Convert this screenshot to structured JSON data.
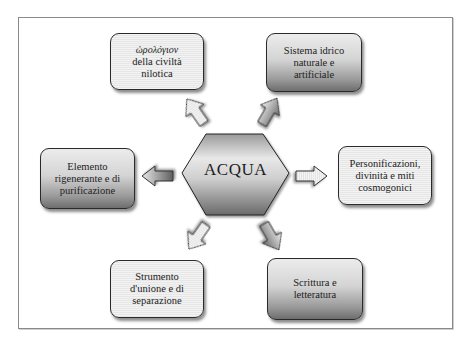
{
  "diagram": {
    "center": {
      "label": "ACQUA"
    },
    "nodes": [
      {
        "id": "top-left",
        "lines": [
          "ὡρολόγιον",
          "della civiltà",
          "nilotica"
        ],
        "style": "light"
      },
      {
        "id": "top-right",
        "lines": [
          "Sistema idrico",
          "naturale e",
          "artificiale"
        ],
        "style": "dark"
      },
      {
        "id": "left",
        "lines": [
          "Elemento",
          "rigenerante e di",
          "purificazione"
        ],
        "style": "dark"
      },
      {
        "id": "right",
        "lines": [
          "Personificazioni,",
          "divinità e miti",
          "cosmogonici"
        ],
        "style": "light"
      },
      {
        "id": "bottom-left",
        "lines": [
          "Strumento",
          "d'unione e di",
          "separazione"
        ],
        "style": "light"
      },
      {
        "id": "bottom-right",
        "lines": [
          "Scrittura e",
          "letteratura"
        ],
        "style": "dark"
      }
    ],
    "arrows": [
      {
        "from": "center",
        "to": "top-left",
        "style": "light"
      },
      {
        "from": "center",
        "to": "top-right",
        "style": "dark"
      },
      {
        "from": "center",
        "to": "left",
        "style": "dark"
      },
      {
        "from": "center",
        "to": "right",
        "style": "light"
      },
      {
        "from": "center",
        "to": "bottom-left",
        "style": "light"
      },
      {
        "from": "center",
        "to": "bottom-right",
        "style": "dark"
      }
    ]
  }
}
